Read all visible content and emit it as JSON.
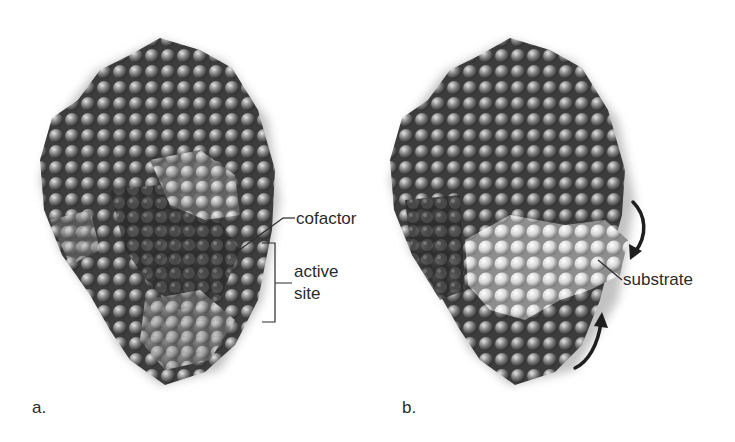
{
  "figure": {
    "panels": [
      {
        "id": "a",
        "letter": "a.",
        "labels": {
          "cofactor": "cofactor",
          "active_site_line1": "active",
          "active_site_line2": "site"
        }
      },
      {
        "id": "b",
        "letter": "b.",
        "labels": {
          "substrate": "substrate"
        },
        "arrows": [
          "curved-arrow-down",
          "curved-arrow-up"
        ]
      }
    ],
    "colors": {
      "background": "#ffffff",
      "protein_dark": "#3a3a3a",
      "protein_mid": "#6e6e6e",
      "protein_light": "#bdbdbd",
      "substrate": "#e2e2e2",
      "label_text": "#2b2b2b",
      "leader_line": "#2b2b2b"
    }
  }
}
